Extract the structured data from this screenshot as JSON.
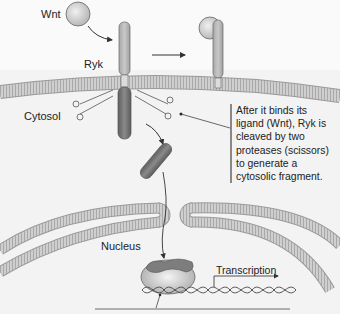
{
  "diagram": {
    "labels": {
      "wnt": "Wnt",
      "ryk": "Ryk",
      "cytosol": "Cytosol",
      "nucleus": "Nucleus",
      "transcription": "Transcription"
    },
    "caption_lines": [
      "After it binds its",
      "ligand (Wnt), Ryk is",
      "cleaved by two",
      "proteases (scissors)",
      "to generate a",
      "cytosolic fragment."
    ],
    "colors": {
      "background": "#f4f4f4",
      "membrane": "#c8c8c8",
      "membrane_stripe": "#a8a8a8",
      "ryk_extracellular": "#b9b9b9",
      "ryk_intracellular": "#7a7a7a",
      "wnt": "#d6d6d6",
      "nucleus_bg": "#ececec",
      "dna": "#555555",
      "text": "#222222"
    }
  }
}
